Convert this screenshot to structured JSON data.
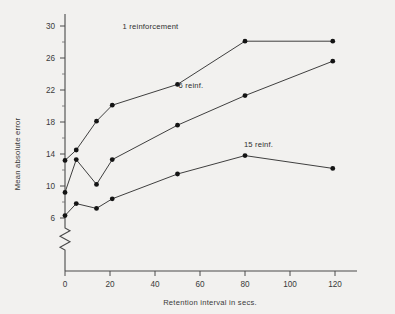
{
  "chart_data": {
    "type": "line",
    "title": "",
    "subtitle": "",
    "xlabel": "Retention interval in secs.",
    "ylabel": "Mean absolute error",
    "xlim": [
      0,
      128
    ],
    "ylim": [
      5,
      31
    ],
    "xticks": [
      0,
      20,
      40,
      60,
      80,
      100,
      120
    ],
    "xtick_labels": [
      "0",
      "20",
      "40",
      "60",
      "80",
      "100",
      "120"
    ],
    "yticks": [
      6,
      10,
      14,
      18,
      22,
      26,
      30
    ],
    "ytick_labels": [
      "6",
      "10",
      "14",
      "18",
      "22",
      "26",
      "30"
    ],
    "y_minor_ticks": [
      8,
      12,
      16,
      20,
      24,
      28
    ],
    "grid": false,
    "legend_position": "inline-annotations",
    "y_axis_break": true,
    "marker": "filled-circle",
    "series": [
      {
        "name": "1 reinforcement",
        "label_x": 38,
        "label_y": 29.6,
        "x": [
          0,
          5,
          14,
          21,
          50,
          80,
          119
        ],
        "values": [
          13.2,
          14.5,
          18.1,
          20.1,
          22.7,
          28.1,
          28.1
        ]
      },
      {
        "name": "6 reinf.",
        "label_x": 56,
        "label_y": 22.3,
        "x": [
          0,
          5,
          14,
          21,
          50,
          80,
          119
        ],
        "values": [
          9.2,
          13.3,
          10.2,
          13.3,
          17.6,
          21.3,
          25.6
        ]
      },
      {
        "name": "15 reinf.",
        "label_x": 86,
        "label_y": 14.9,
        "x": [
          0,
          5,
          14,
          21,
          50,
          80,
          119
        ],
        "values": [
          6.3,
          7.8,
          7.2,
          8.4,
          11.5,
          13.8,
          12.2
        ]
      }
    ],
    "annotations": [
      {
        "text": "1 reinforcement"
      },
      {
        "text": "6 reinf."
      },
      {
        "text": "15 reinf."
      }
    ],
    "colors": {
      "background": "#f2f1ef",
      "axis": "#4a4a4a",
      "line": "#1f1f1f",
      "marker": "#141414",
      "text": "#3a3a3a"
    }
  }
}
